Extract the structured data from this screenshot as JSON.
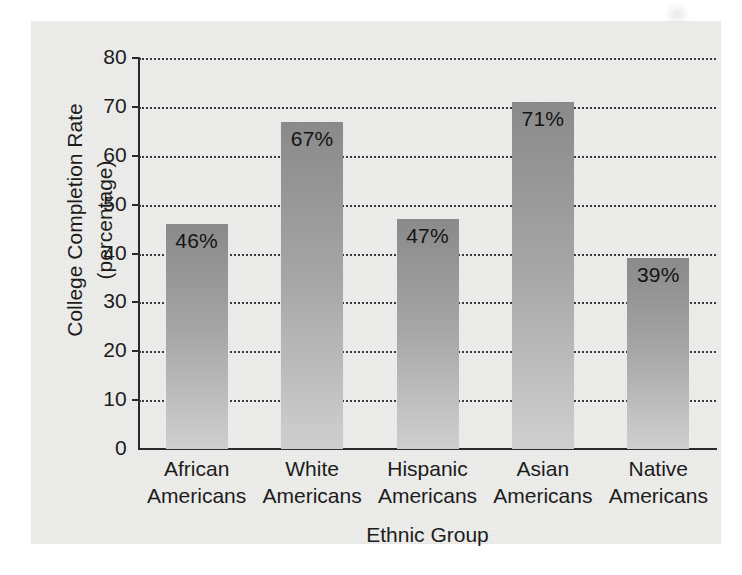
{
  "chart_data": {
    "type": "bar",
    "title": "",
    "subtitle": "",
    "xlabel": "Ethnic Group",
    "ylabel_line1": "College Completion Rate",
    "ylabel_line2": "(percentage)",
    "categories": [
      "African Americans",
      "White Americans",
      "Hispanic Americans",
      "Asian Americans",
      "Native Americans"
    ],
    "category_lines": [
      [
        "African",
        "Americans"
      ],
      [
        "White",
        "Americans"
      ],
      [
        "Hispanic",
        "Americans"
      ],
      [
        "Asian",
        "Americans"
      ],
      [
        "Native",
        "Americans"
      ]
    ],
    "values": [
      46,
      67,
      47,
      71,
      39
    ],
    "value_labels": [
      "46%",
      "67%",
      "47%",
      "71%",
      "39%"
    ],
    "ylim": [
      0,
      80
    ],
    "ytick_values": [
      0,
      10,
      20,
      30,
      40,
      50,
      60,
      70,
      80
    ],
    "ytick_labels": [
      "0",
      "10",
      "20",
      "30",
      "40",
      "50",
      "60",
      "70",
      "80"
    ],
    "grid": true,
    "grid_style": "dotted",
    "legend": "none",
    "bar_color_top": "#8a8a8a",
    "bar_color_bottom": "#cfcfcf",
    "axis_color": "#2a2a2a",
    "background_color": "#ececea",
    "text_color": "#1c1c1c"
  }
}
